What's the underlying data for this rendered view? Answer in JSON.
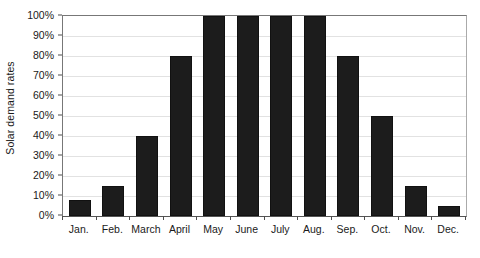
{
  "chart_data": {
    "type": "bar",
    "title": "",
    "xlabel": "",
    "ylabel": "Solar demand rates",
    "categories": [
      "Jan.",
      "Feb.",
      "March",
      "April",
      "May",
      "June",
      "July",
      "Aug.",
      "Sep.",
      "Oct.",
      "Nov.",
      "Dec."
    ],
    "values": [
      8,
      15,
      40,
      80,
      100,
      100,
      100,
      100,
      80,
      50,
      15,
      5
    ],
    "value_suffix": "%",
    "ylim": [
      0,
      100
    ],
    "ytick_labels": [
      "0%",
      "10%",
      "20%",
      "30%",
      "40%",
      "50%",
      "60%",
      "70%",
      "80%",
      "90%",
      "100%"
    ],
    "ytick_values": [
      0,
      10,
      20,
      30,
      40,
      50,
      60,
      70,
      80,
      90,
      100
    ],
    "grid": true,
    "legend": "none",
    "bar_color": "#1c1c1c",
    "gridline_color": "#e2e2e2",
    "axis_color": "#555555",
    "background_color": "#ffffff"
  }
}
